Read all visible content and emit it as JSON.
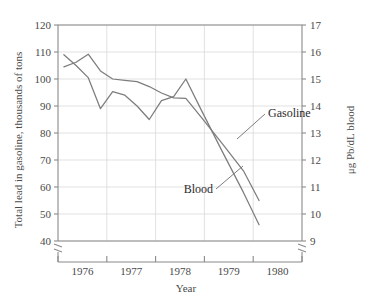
{
  "chart_data": {
    "type": "line",
    "title": "",
    "xlabel": "Year",
    "ylabel": "Total lead in gasoline, thousands of tons",
    "y2label": "μg Pb/dL blood",
    "xlim": [
      1975.5,
      1980.5
    ],
    "ylim": [
      40,
      120
    ],
    "y2lim": [
      9,
      17
    ],
    "grid": true,
    "legend": "inline-annotations",
    "x_tick_labels": [
      "1976",
      "1977",
      "1978",
      "1979",
      "1980"
    ],
    "x_tick_positions": [
      1976,
      1977,
      1978,
      1979,
      1980
    ],
    "y_tick_labels": [
      "40",
      "50",
      "60",
      "70",
      "80",
      "90",
      "100",
      "110",
      "120"
    ],
    "y_ticks": [
      40,
      50,
      60,
      70,
      80,
      90,
      100,
      110,
      120
    ],
    "y2_tick_labels": [
      "9",
      "10",
      "11",
      "12",
      "13",
      "14",
      "15",
      "16",
      "17"
    ],
    "y2_ticks": [
      9,
      10,
      11,
      12,
      13,
      14,
      15,
      16,
      17
    ],
    "axis_break_left": true,
    "axis_break_right": true,
    "line_color": "#7d7d7d",
    "grid_color": "#d9d9d9",
    "axis_color": "#8a8a8a",
    "series": [
      {
        "name": "Gasoline",
        "axis": "left",
        "units": "thousands of tons",
        "label_text": "Gasoline",
        "x": [
          1975.62,
          1975.87,
          1976.12,
          1976.37,
          1976.62,
          1976.87,
          1977.12,
          1977.37,
          1977.62,
          1977.87,
          1978.12,
          1978.45,
          1978.87,
          1979.3,
          1979.62
        ],
        "values": [
          109.0,
          105.0,
          100.5,
          89.0,
          95.3,
          94.0,
          90.0,
          85.0,
          92.0,
          93.5,
          100.0,
          88.0,
          73.0,
          58.0,
          46.0
        ]
      },
      {
        "name": "Blood",
        "axis": "right",
        "units": "μg Pb/dL",
        "label_text": "Blood",
        "x": [
          1975.62,
          1975.87,
          1976.12,
          1976.37,
          1976.62,
          1976.87,
          1977.12,
          1977.37,
          1977.62,
          1977.87,
          1978.12,
          1978.45,
          1978.87,
          1979.3,
          1979.62
        ],
        "values": [
          15.45,
          15.62,
          15.92,
          15.3,
          15.0,
          14.95,
          14.9,
          14.72,
          14.48,
          14.3,
          14.28,
          13.55,
          12.6,
          11.6,
          10.5
        ]
      }
    ],
    "annotations": [
      {
        "name": "gasoline-label",
        "text": "Gasoline",
        "anchor_x": 1979.02,
        "anchor_y_px": 113
      },
      {
        "name": "blood-label",
        "text": "Blood",
        "anchor_x": 1978.33,
        "anchor_y_px": 189
      }
    ]
  },
  "axes": {
    "x_title": "Year",
    "y_left_title": "Total lead in gasoline, thousands of tons",
    "y_right_title": "μg Pb/dL blood"
  }
}
